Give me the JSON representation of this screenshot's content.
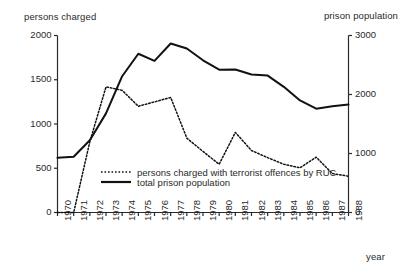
{
  "chart_data": {
    "type": "line",
    "title": "",
    "xlabel": "year",
    "ylabel": "persons charged",
    "y2label": "prison population",
    "grid": false,
    "legend_position": "inside-lower-left",
    "categories": [
      "1970",
      "1971",
      "1972",
      "1973",
      "1974",
      "1975",
      "1976",
      "1977",
      "1978",
      "1979",
      "1980",
      "1981",
      "1982",
      "1983",
      "1984",
      "1985",
      "1986",
      "1987",
      "1988"
    ],
    "xlim": [
      1970,
      1988
    ],
    "ylim": [
      0,
      2000
    ],
    "y2lim": [
      0,
      3000
    ],
    "yticks": [
      "0",
      "500",
      "1000",
      "1500",
      "2000"
    ],
    "ytick_values": [
      0,
      500,
      1000,
      1500,
      2000
    ],
    "y2ticks": [
      "0",
      "1000",
      "2000",
      "3000"
    ],
    "y2tick_values": [
      0,
      1000,
      2000,
      3000
    ],
    "series": [
      {
        "name": "persons charged with terrorist offences by RUC",
        "axis": "left",
        "style": "dotted",
        "values": [
          0,
          0,
          800,
          1420,
          1380,
          1200,
          1250,
          1300,
          840,
          690,
          545,
          905,
          700,
          620,
          545,
          505,
          625,
          440,
          410
        ]
      },
      {
        "name": "total prison population",
        "axis": "right",
        "style": "solid",
        "values": [
          930,
          945,
          1225,
          1680,
          2310,
          2690,
          2570,
          2865,
          2780,
          2580,
          2420,
          2425,
          2340,
          2320,
          2130,
          1900,
          1760,
          1800,
          1830
        ]
      }
    ]
  },
  "axes": {
    "left_title": "persons charged",
    "right_title": "prison population",
    "x_title": "year"
  },
  "legend": {
    "entries": [
      {
        "label": "persons charged with terrorist offences by RUC",
        "marker": "dotted-line"
      },
      {
        "label": "total prison population",
        "marker": "solid-line"
      }
    ]
  },
  "colors": {
    "axis": "#2a2a2a",
    "line_solid": "#111111",
    "line_dotted": "#111111",
    "background": "#ffffff"
  }
}
